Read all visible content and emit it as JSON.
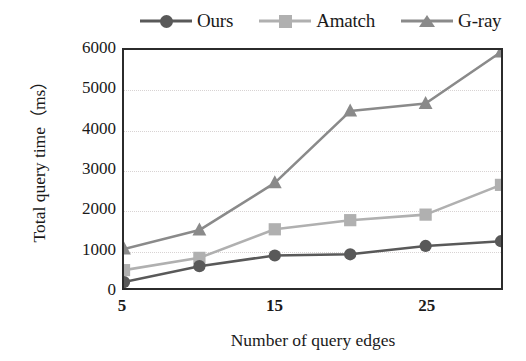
{
  "chart_data": {
    "type": "line",
    "title": "",
    "xlabel": "Number of query edges",
    "ylabel": "Total query time（ms）",
    "x": [
      5,
      10,
      15,
      20,
      25,
      30
    ],
    "xtick_labels": [
      "5",
      "15",
      "25"
    ],
    "xtick_values": [
      5,
      15,
      25
    ],
    "ytick_labels": [
      "0",
      "1000",
      "2000",
      "3000",
      "4000",
      "5000",
      "6000"
    ],
    "ytick_values": [
      0,
      1000,
      2000,
      3000,
      4000,
      5000,
      6000
    ],
    "xlim": [
      5,
      30
    ],
    "ylim": [
      0,
      6000
    ],
    "grid": "horizontal-dotted",
    "legend_position": "top",
    "series": [
      {
        "name": "Ours",
        "marker": "circle",
        "color": "#595959",
        "values": [
          150,
          550,
          820,
          850,
          1060,
          1180
        ]
      },
      {
        "name": "Amatch",
        "marker": "square",
        "color": "#b0b0b0",
        "values": [
          450,
          760,
          1480,
          1710,
          1850,
          2600
        ]
      },
      {
        "name": "G-ray",
        "marker": "triangle",
        "color": "#8a8a8a",
        "values": [
          980,
          1460,
          2650,
          4460,
          4650,
          5950
        ]
      }
    ]
  },
  "legend": {
    "items": [
      {
        "label": "Ours",
        "marker": "circle-marker",
        "color": "#595959"
      },
      {
        "label": "Amatch",
        "marker": "square-marker",
        "color": "#b0b0b0"
      },
      {
        "label": "G-ray",
        "marker": "triangle-marker",
        "color": "#8a8a8a"
      }
    ]
  },
  "axes": {
    "x_title": "Number of query edges",
    "y_title": "Total query time（ms）"
  },
  "colors": {
    "frame": "#2b2b2b",
    "grid": "#d8d3d3",
    "background": "#ffffff"
  }
}
